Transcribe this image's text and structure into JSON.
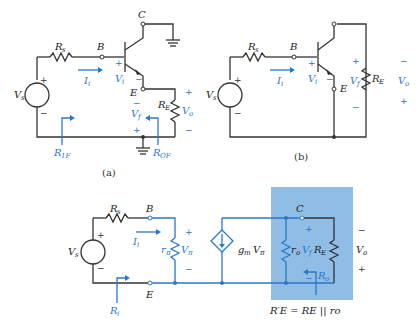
{
  "figure": {
    "a": {
      "caption": "(a)",
      "labels": {
        "Rs": "R",
        "Rs_sub": "s",
        "B": "B",
        "C": "C",
        "E": "E",
        "Ii": "I",
        "Ii_sub": "i",
        "Vi": "V",
        "Vi_sub": "i",
        "Vs": "V",
        "Vs_sub": "s",
        "RE": "R",
        "RE_sub": "E",
        "Vo": "V",
        "Vo_sub": "o",
        "Vf": "V",
        "Vf_sub": "f",
        "R1F": "R",
        "R1F_sub": "1F",
        "ROF": "R",
        "ROF_sub": "OF"
      }
    },
    "b": {
      "caption": "(b)",
      "labels": {
        "Rs": "R",
        "Rs_sub": "s",
        "B": "B",
        "E": "E",
        "Ii": "I",
        "Ii_sub": "i",
        "Vi": "V",
        "Vi_sub": "i",
        "Vs": "V",
        "Vs_sub": "s",
        "RE": "R",
        "RE_sub": "E",
        "Vo": "V",
        "Vo_sub": "o",
        "Vf": "V",
        "Vf_sub": "f"
      }
    },
    "c": {
      "labels": {
        "Rs": "R",
        "Rs_sub": "s",
        "B": "B",
        "C": "C",
        "E": "E",
        "Ii": "I",
        "Ii_sub": "i",
        "Vs": "V",
        "Vs_sub": "s",
        "rpi": "r",
        "rpi_sub": "π",
        "Vpi": "V",
        "Vpi_sub": "π",
        "gm": "g",
        "gm_sub": "m",
        "gmV": "V",
        "gmV_sub": "π",
        "ro": "r",
        "ro_sub": "o",
        "Vf": "V",
        "Vf_sub": "f",
        "RE": "R",
        "RE_sub": "E",
        "Vo": "V",
        "Vo_sub": "o",
        "Ri": "R",
        "Ri_sub": "i",
        "Ro": "R",
        "Ro_sub": "o"
      },
      "equation": "R′E = RE || ro"
    },
    "colors": {
      "wire": "#333333",
      "accent": "#2a78c8",
      "shade": "#8fbde6"
    }
  }
}
